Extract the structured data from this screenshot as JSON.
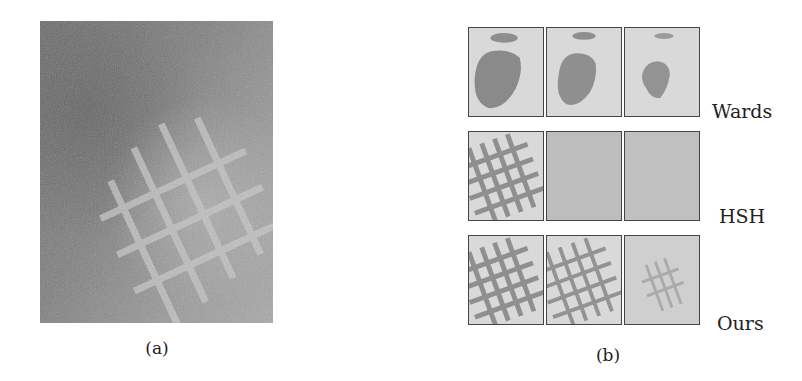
{
  "figure": {
    "panel_a": {
      "caption": "(a)",
      "description": "Grayscale photograph of a woven grid/mesh structure on a textured surface"
    },
    "panel_b": {
      "caption": "(b)",
      "rows": [
        {
          "label": "Wards",
          "cells": [
            "blob",
            "blob",
            "blob-small"
          ]
        },
        {
          "label": "HSH",
          "cells": [
            "grid",
            "noise",
            "noise"
          ]
        },
        {
          "label": "Ours",
          "cells": [
            "grid",
            "grid",
            "grid-faint"
          ]
        }
      ]
    }
  }
}
